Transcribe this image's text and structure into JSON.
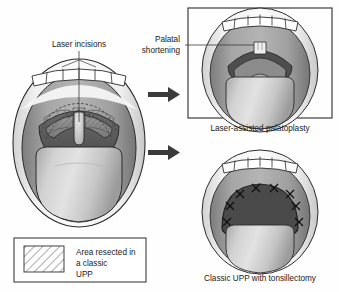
{
  "figure": {
    "background_color": "#fefefe"
  },
  "labels": {
    "laser_incisions": "Laser incisions",
    "palatal_shortening_line1": "Palatal",
    "palatal_shortening_line2": "shortening"
  },
  "panels": [
    {
      "id": "main",
      "name": "pre-operative-mouth",
      "caption": ""
    },
    {
      "id": "top-right",
      "name": "laser-assisted-palatoplasty",
      "caption": "Laser-assisted palatoplasty"
    },
    {
      "id": "bottom-right",
      "name": "classic-upp-tonsillectomy",
      "caption": "Classic UPP with tonsillectomy"
    }
  ],
  "legend": {
    "line1": "Area resected in",
    "line2": "a classic",
    "line3": "UPP",
    "swatch_name": "hatched-resection-swatch"
  },
  "arrows": [
    {
      "name": "arrow-to-palatoplasty"
    },
    {
      "name": "arrow-to-classic-upp"
    }
  ],
  "colors": {
    "outline": "#2b2b2b",
    "lip_light": "#e6e6e6",
    "mucosa_mid": "#9d9d9d",
    "mucosa_dark": "#6f6f6f",
    "pharynx_dark": "#595959",
    "tongue_light": "#c9c9c9",
    "teeth_white": "#ffffff",
    "arrow": "#3b3b3b",
    "border": "#2b2b2b"
  }
}
